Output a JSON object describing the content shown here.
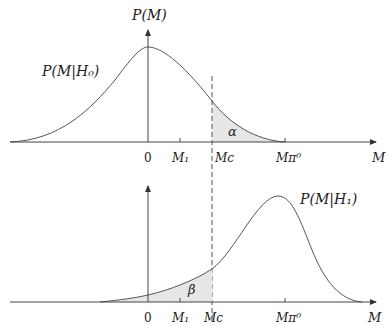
{
  "top_panel": {
    "y_axis_label": "P(M)",
    "curve_label": "P(M|H₀)",
    "region_label": "α",
    "x_axis_label": "M",
    "ticks": [
      "0",
      "M₁",
      "Mc",
      "Mπ⁰"
    ]
  },
  "bottom_panel": {
    "curve_label": "P(M|H₁)",
    "region_label": "β",
    "x_axis_label": "M",
    "ticks": [
      "0",
      "M₁",
      "Mc",
      "Mπ⁰"
    ]
  },
  "colors": {
    "line": "#444444",
    "shade": "#e6e6e6"
  }
}
